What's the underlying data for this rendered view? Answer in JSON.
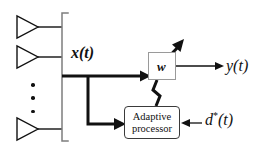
{
  "diagram": {
    "background_color": "#ffffff",
    "line_color": "#111111",
    "box_border_color": "#3a3a3a",
    "weight_box_border_color": "#9a9a9a"
  },
  "array": {
    "name": "antenna-array",
    "element_count_shown": 3,
    "ellipsis": "vertical-ellipsis",
    "bracket": "left-array-bracket",
    "elements": [
      {
        "label": "",
        "name": "antenna-element-1"
      },
      {
        "label": "",
        "name": "antenna-element-2"
      },
      {
        "label": "",
        "name": "antenna-element-3"
      }
    ]
  },
  "signals": {
    "input_label": "x(t)",
    "output_label": "y(t)",
    "reference_label_base": "d",
    "reference_label_star": "*",
    "reference_label_arg": "(t)"
  },
  "blocks": {
    "weight": {
      "label": "w",
      "name": "weight-block",
      "adaptive_arrow": "adaptive-weight-arrow"
    },
    "adaptive_processor": {
      "line1": "Adaptive",
      "line2": "processor",
      "name": "adaptive-processor-block"
    }
  },
  "connections": [
    {
      "name": "array-to-weight-path",
      "style": "thick"
    },
    {
      "name": "array-branch-to-processor-path",
      "style": "thick"
    },
    {
      "name": "weight-to-output-path",
      "style": "thin"
    },
    {
      "name": "weight-to-processor-feedback-path",
      "style": "thick"
    },
    {
      "name": "reference-to-processor-path",
      "style": "thin"
    }
  ]
}
